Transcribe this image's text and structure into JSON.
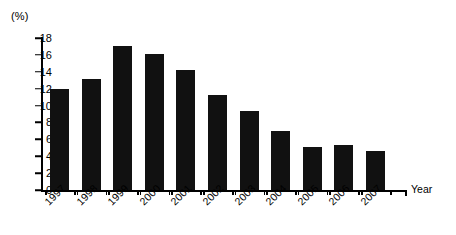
{
  "chart_data": {
    "type": "bar",
    "title": "",
    "subtitle": "",
    "xlabel": "Year",
    "ylabel": "(%)",
    "unit_label": "(%)",
    "categories": [
      "1997",
      "1998",
      "1999",
      "2000",
      "2001",
      "2002",
      "2003",
      "2004",
      "2005",
      "2006",
      "2007"
    ],
    "values": [
      12.0,
      13.1,
      17.0,
      16.1,
      14.2,
      11.3,
      9.3,
      7.0,
      5.1,
      5.3,
      4.6
    ],
    "ylim": [
      0,
      18
    ],
    "ytick_labels": [
      "0",
      "2",
      "4",
      "6",
      "8",
      "10",
      "12",
      "14",
      "16",
      "18"
    ],
    "ytick_values": [
      0,
      2,
      4,
      6,
      8,
      10,
      12,
      14,
      16,
      18
    ],
    "grid": false,
    "legend": false,
    "legend_position": "none",
    "bar_color": "#111111",
    "axis_color": "#000000",
    "background_color": "#ffffff",
    "xtick_label_rotation": -45
  }
}
